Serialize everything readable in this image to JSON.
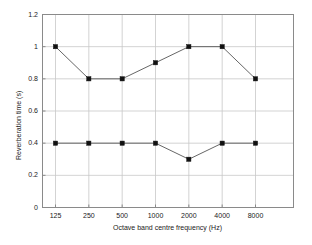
{
  "chart_data": {
    "type": "line",
    "title": "",
    "subtitle": "",
    "xlabel": "Octave band centre frequency (Hz)",
    "ylabel": "Reverberation time (s)",
    "categories": [
      "125",
      "250",
      "500",
      "1000",
      "2000",
      "4000",
      "8000"
    ],
    "x_tick_labels": [
      "125",
      "250",
      "500",
      "1000",
      "2000",
      "4000",
      "8000"
    ],
    "y_tick_labels": [
      "0",
      "0.2",
      "0.4",
      "0.6",
      "0.8",
      "1",
      "1.2"
    ],
    "y_tick_values": [
      0,
      0.2,
      0.4,
      0.6,
      0.8,
      1.0,
      1.2
    ],
    "ylim": [
      0,
      1.2
    ],
    "grid": true,
    "legend": "none",
    "marker": "square",
    "series": [
      {
        "name": "upper-curve",
        "values": [
          1.0,
          0.8,
          0.8,
          0.9,
          1.0,
          1.0,
          0.8
        ],
        "color": "#555555"
      },
      {
        "name": "lower-curve",
        "values": [
          0.4,
          0.4,
          0.4,
          0.4,
          0.3,
          0.4,
          0.4
        ],
        "color": "#555555"
      }
    ]
  },
  "colors": {
    "axis": "#8a8a8a",
    "grid": "#c8c8c8",
    "line": "#555555",
    "marker": "#111111",
    "background": "#ffffff"
  }
}
